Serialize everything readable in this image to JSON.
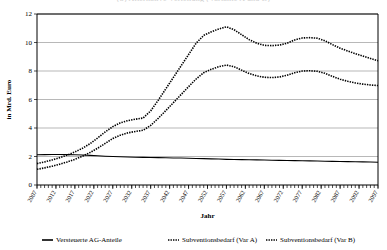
{
  "title_clipped": "(b) Alternative Verteilung (Variante A und B)",
  "chart_data": {
    "type": "line",
    "title": "",
    "xlabel": "Jahr",
    "ylabel": "in Mrd. Euro",
    "ylim": [
      0,
      12
    ],
    "ytick_values": [
      0,
      2,
      4,
      6,
      8,
      10,
      12
    ],
    "ytick_labels": [
      "0",
      "2",
      "4",
      "6",
      "8",
      "10",
      "12"
    ],
    "xlim": [
      2007,
      2097
    ],
    "xtick_labels": [
      "2007",
      "2012",
      "2017",
      "2022",
      "2027",
      "2032",
      "2037",
      "2042",
      "2047",
      "2052",
      "2057",
      "2062",
      "2067",
      "2072",
      "2077",
      "2082",
      "2087",
      "2092",
      "2097"
    ],
    "xtick_step": 5,
    "minor_tick_step": 1,
    "grid": "horizontal",
    "legend_position": "bottom",
    "x": [
      2007,
      2009,
      2011,
      2013,
      2015,
      2017,
      2019,
      2021,
      2023,
      2025,
      2027,
      2029,
      2031,
      2033,
      2035,
      2037,
      2039,
      2041,
      2043,
      2045,
      2047,
      2049,
      2051,
      2053,
      2055,
      2057,
      2059,
      2061,
      2063,
      2065,
      2067,
      2069,
      2071,
      2073,
      2075,
      2077,
      2079,
      2081,
      2083,
      2085,
      2087,
      2089,
      2091,
      2093,
      2095,
      2097
    ],
    "series": [
      {
        "name": "Versteuerte AG-Anteile",
        "style": "solid",
        "values": [
          2.12,
          2.13,
          2.14,
          2.14,
          2.13,
          2.12,
          2.1,
          2.08,
          2.05,
          2.02,
          2.0,
          1.98,
          1.96,
          1.95,
          1.94,
          1.93,
          1.92,
          1.91,
          1.9,
          1.89,
          1.88,
          1.86,
          1.85,
          1.83,
          1.82,
          1.8,
          1.79,
          1.78,
          1.77,
          1.76,
          1.75,
          1.74,
          1.73,
          1.72,
          1.71,
          1.7,
          1.69,
          1.68,
          1.67,
          1.66,
          1.65,
          1.64,
          1.63,
          1.62,
          1.61,
          1.6
        ]
      },
      {
        "name": "Subventionsbedarf (Var A)",
        "style": "dotted",
        "values": [
          1.5,
          1.62,
          1.76,
          1.92,
          2.1,
          2.32,
          2.58,
          2.9,
          3.3,
          3.72,
          4.1,
          4.36,
          4.52,
          4.62,
          4.7,
          5.2,
          5.95,
          6.75,
          7.55,
          8.35,
          9.15,
          9.95,
          10.5,
          10.75,
          10.95,
          11.1,
          10.9,
          10.55,
          10.2,
          9.95,
          9.8,
          9.78,
          9.82,
          9.95,
          10.18,
          10.32,
          10.34,
          10.3,
          10.12,
          9.85,
          9.6,
          9.4,
          9.22,
          9.05,
          8.88,
          8.72
        ]
      },
      {
        "name": "Subventionsbedarf (Var B)",
        "style": "dotted",
        "values": [
          1.1,
          1.2,
          1.32,
          1.46,
          1.62,
          1.8,
          2.02,
          2.28,
          2.58,
          2.92,
          3.26,
          3.5,
          3.66,
          3.76,
          3.84,
          4.18,
          4.68,
          5.22,
          5.78,
          6.34,
          6.9,
          7.44,
          7.88,
          8.12,
          8.3,
          8.42,
          8.3,
          8.06,
          7.82,
          7.66,
          7.56,
          7.54,
          7.58,
          7.7,
          7.88,
          8.0,
          8.02,
          7.98,
          7.84,
          7.62,
          7.42,
          7.28,
          7.16,
          7.08,
          7.02,
          6.98
        ]
      }
    ],
    "legend": [
      {
        "label": "Versteuerte AG-Anteile",
        "marker": "solid-line"
      },
      {
        "label": "Subventionsbedarf (Var A)",
        "marker": "dotted-line"
      },
      {
        "label": "Subventionsbedarf (Var B)",
        "marker": "dotted-line"
      }
    ]
  }
}
